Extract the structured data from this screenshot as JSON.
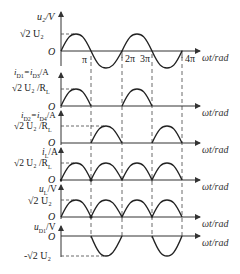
{
  "figure": {
    "x_axis_label": "ωt/rad",
    "x_ticks": [
      "π",
      "2π",
      "3π",
      "4π"
    ],
    "origin_label": "O",
    "panels": [
      {
        "id": "u2",
        "y_label": "u₂/V",
        "peak_label": "√2 U₂",
        "waveform": "sine"
      },
      {
        "id": "iD1",
        "y_label": "i_D1=i_D3/A",
        "peak_label": "√2 U₂ /R_L",
        "waveform": "half-wave positive (0–π, 2π–3π)"
      },
      {
        "id": "iD2",
        "y_label": "i_D2=i_D4/A",
        "peak_label": "√2 U₂ /R_L",
        "waveform": "half-wave (π–2π, 3π–4π)"
      },
      {
        "id": "iL",
        "y_label": "i_L/A",
        "peak_label": "√2 U₂ /R_L",
        "waveform": "full-wave rectified"
      },
      {
        "id": "uL",
        "y_label": "u_L/V",
        "peak_label": "√2 U₂",
        "waveform": "full-wave rectified"
      },
      {
        "id": "uD1",
        "y_label": "u_D1/V",
        "peak_label": "-√2 U₂",
        "waveform": "negative half-wave (π–2π, 3π–4π)"
      }
    ]
  },
  "labels": {
    "u2_y": "u₂/V",
    "u2_peak": "√2 U₂",
    "iD1_y": "i",
    "iD1_y_sub": "D1",
    "iD1_y_mid": "=i",
    "iD1_y_sub2": "D3",
    "iD1_y_unit": "/A",
    "iD2_y": "i",
    "iD2_y_sub": "D2",
    "iD2_y_mid": "=i",
    "iD2_y_sub2": "D4",
    "iD2_y_unit": "/A",
    "iL_y": "i",
    "iL_y_sub": "L",
    "iL_y_unit": "/A",
    "uL_y": "u",
    "uL_y_sub": "L",
    "uL_y_unit": "/V",
    "uD1_y": "u",
    "uD1_y_sub": "D1",
    "uD1_y_unit": "/V",
    "peak_current": "√2 U₂ /R",
    "peak_current_sub": "L",
    "peak_voltage": "√2 U₂",
    "neg_peak_voltage": "-√2 U₂",
    "origin": "O",
    "x_axis": "ωt/rad",
    "tick_pi": "π",
    "tick_2pi": "2π",
    "tick_3pi": "3π",
    "tick_4pi": "4π"
  }
}
